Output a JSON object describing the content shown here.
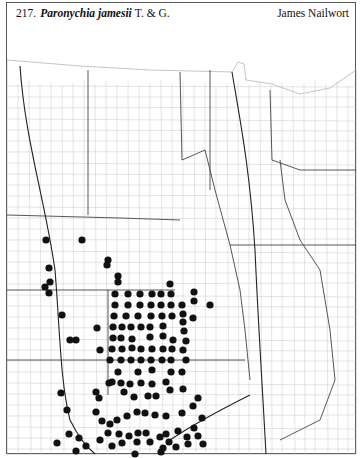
{
  "header": {
    "number": "217.",
    "scientific_name": "Paronychia jamesii",
    "authority": "T. & G.",
    "common_name": "James Nailwort"
  },
  "map": {
    "region": "Great Plains (county outline map)",
    "dot_color": "#111111",
    "line_color": "#555555",
    "occurrence_dots": [
      [
        46,
        240
      ],
      [
        82,
        240
      ],
      [
        108,
        260
      ],
      [
        107,
        265
      ],
      [
        49,
        268
      ],
      [
        118,
        276
      ],
      [
        50,
        282
      ],
      [
        45,
        287
      ],
      [
        49,
        293
      ],
      [
        118,
        282
      ],
      [
        170,
        284
      ],
      [
        62,
        315
      ],
      [
        115,
        294
      ],
      [
        128,
        294
      ],
      [
        140,
        294
      ],
      [
        152,
        294
      ],
      [
        161,
        294
      ],
      [
        171,
        294
      ],
      [
        194,
        292
      ],
      [
        115,
        305
      ],
      [
        128,
        305
      ],
      [
        140,
        305
      ],
      [
        151,
        305
      ],
      [
        161,
        305
      ],
      [
        171,
        305
      ],
      [
        182,
        305
      ],
      [
        194,
        301
      ],
      [
        210,
        305
      ],
      [
        114,
        316
      ],
      [
        126,
        316
      ],
      [
        138,
        316
      ],
      [
        151,
        316
      ],
      [
        162,
        316
      ],
      [
        172,
        316
      ],
      [
        183,
        314
      ],
      [
        193,
        318
      ],
      [
        113,
        327
      ],
      [
        122,
        327
      ],
      [
        131,
        327
      ],
      [
        141,
        327
      ],
      [
        150,
        327
      ],
      [
        163,
        326
      ],
      [
        183,
        322
      ],
      [
        97,
        328
      ],
      [
        113,
        338
      ],
      [
        121,
        338
      ],
      [
        132,
        339
      ],
      [
        150,
        337
      ],
      [
        163,
        336
      ],
      [
        173,
        340
      ],
      [
        184,
        331
      ],
      [
        76,
        340
      ],
      [
        112,
        349
      ],
      [
        122,
        349
      ],
      [
        132,
        348
      ],
      [
        141,
        349
      ],
      [
        152,
        349
      ],
      [
        163,
        349
      ],
      [
        172,
        349
      ],
      [
        183,
        350
      ],
      [
        186,
        341
      ],
      [
        100,
        350
      ],
      [
        110,
        360
      ],
      [
        121,
        360
      ],
      [
        131,
        360
      ],
      [
        141,
        360
      ],
      [
        151,
        360
      ],
      [
        162,
        360
      ],
      [
        171,
        360
      ],
      [
        186,
        360
      ],
      [
        118,
        372
      ],
      [
        138,
        372
      ],
      [
        152,
        370
      ],
      [
        171,
        372
      ],
      [
        182,
        372
      ],
      [
        61,
        393
      ],
      [
        70,
        340
      ],
      [
        109,
        383
      ],
      [
        121,
        383
      ],
      [
        130,
        384
      ],
      [
        141,
        383
      ],
      [
        152,
        384
      ],
      [
        166,
        382
      ],
      [
        99,
        398
      ],
      [
        96,
        392
      ],
      [
        112,
        382
      ],
      [
        124,
        392
      ],
      [
        134,
        397
      ],
      [
        148,
        396
      ],
      [
        156,
        396
      ],
      [
        170,
        390
      ],
      [
        183,
        389
      ],
      [
        198,
        398
      ],
      [
        96,
        412
      ],
      [
        102,
        421
      ],
      [
        110,
        424
      ],
      [
        117,
        420
      ],
      [
        127,
        416
      ],
      [
        137,
        412
      ],
      [
        145,
        413
      ],
      [
        155,
        415
      ],
      [
        166,
        416
      ],
      [
        108,
        433
      ],
      [
        119,
        434
      ],
      [
        129,
        436
      ],
      [
        138,
        433
      ],
      [
        146,
        433
      ],
      [
        160,
        437
      ],
      [
        166,
        434
      ],
      [
        178,
        431
      ],
      [
        182,
        413
      ],
      [
        202,
        418
      ],
      [
        69,
        434
      ],
      [
        79,
        438
      ],
      [
        86,
        446
      ],
      [
        100,
        440
      ],
      [
        112,
        446
      ],
      [
        122,
        443
      ],
      [
        137,
        442
      ],
      [
        150,
        442
      ],
      [
        163,
        448
      ],
      [
        169,
        442
      ],
      [
        176,
        447
      ],
      [
        188,
        444
      ],
      [
        193,
        406
      ],
      [
        194,
        428
      ],
      [
        198,
        436
      ],
      [
        203,
        444
      ],
      [
        76,
        451
      ],
      [
        135,
        454
      ],
      [
        161,
        452
      ],
      [
        187,
        437
      ],
      [
        57,
        443
      ],
      [
        67,
        410
      ]
    ]
  }
}
